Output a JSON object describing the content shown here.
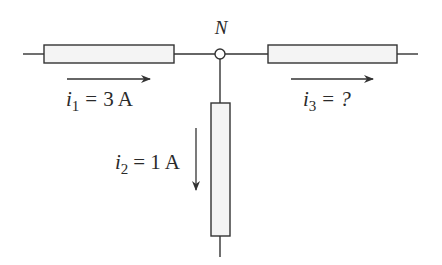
{
  "diagram": {
    "type": "circuit-node-kcl",
    "node": {
      "label": "N"
    },
    "branches": [
      {
        "id": "left",
        "current_symbol": "i",
        "current_subscript": "1",
        "equals": "=",
        "value": "3 A",
        "direction": "toward-node"
      },
      {
        "id": "bottom",
        "current_symbol": "i",
        "current_subscript": "2",
        "equals": "=",
        "value": "1 A",
        "direction": "away-from-node"
      },
      {
        "id": "right",
        "current_symbol": "i",
        "current_subscript": "3",
        "equals": "=",
        "value": "?",
        "direction": "away-from-node"
      }
    ],
    "colors": {
      "line": "#333333",
      "resistor_fill": "#f4f4f4",
      "text": "#2a2a2a",
      "background": "#ffffff"
    }
  }
}
